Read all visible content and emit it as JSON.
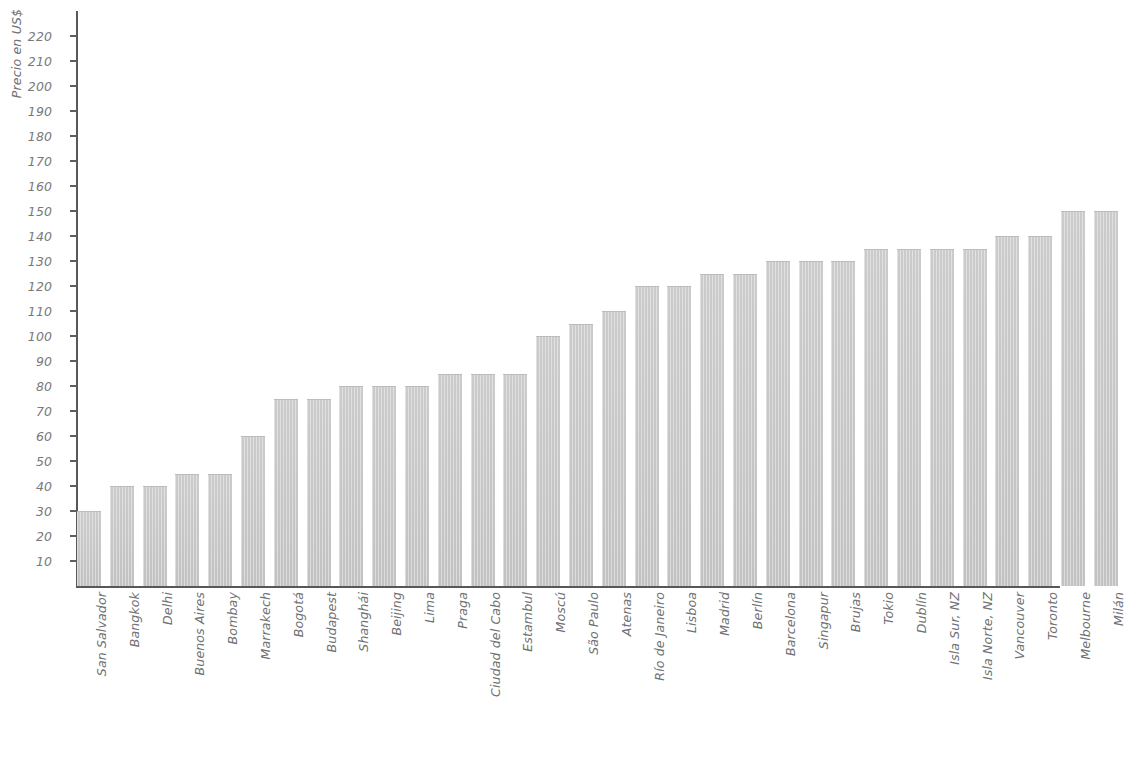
{
  "chart_data": {
    "type": "bar",
    "title": "",
    "xlabel": "",
    "ylabel": "Precio en US$",
    "ylim": [
      0,
      225
    ],
    "ytick_step": 10,
    "yticks": [
      10,
      20,
      30,
      40,
      50,
      60,
      70,
      80,
      90,
      100,
      110,
      120,
      130,
      140,
      150,
      160,
      170,
      180,
      190,
      200,
      210,
      220
    ],
    "grid": false,
    "legend": null,
    "bar_color": "#c8c8c8",
    "axis_color": "#56585b",
    "label_color": "#76787b",
    "categories": [
      "San Salvador",
      "Bangkok",
      "Delhi",
      "Buenos Aires",
      "Bombay",
      "Marrakech",
      "Bogotá",
      "Budapest",
      "Shanghái",
      "Beijing",
      "Lima",
      "Praga",
      "Ciudad del Cabo",
      "Estambul",
      "Moscú",
      "São Paulo",
      "Atenas",
      "Río de Janeiro",
      "Lisboa",
      "Madrid",
      "Berlín",
      "Barcelona",
      "Singapur",
      "Brujas",
      "Tokio",
      "Dublín",
      "Isla Sur, NZ",
      "Isla Norte, NZ",
      "Vancouver",
      "Toronto",
      "Melbourne",
      "Milán"
    ],
    "values": [
      30,
      40,
      40,
      45,
      45,
      60,
      75,
      75,
      80,
      80,
      80,
      85,
      85,
      85,
      100,
      105,
      110,
      120,
      120,
      125,
      125,
      130,
      130,
      130,
      135,
      135,
      135,
      135,
      140,
      140,
      150,
      150
    ]
  }
}
